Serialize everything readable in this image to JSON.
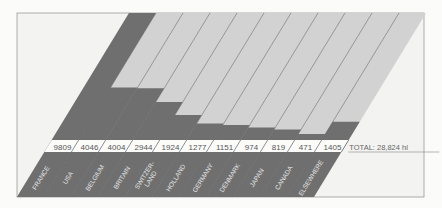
{
  "chart_data": {
    "type": "bar",
    "title": "SALES IN HECTOLITRES",
    "subtitle": "(Source: CIVB)",
    "categories": [
      "FRANCE",
      "USA",
      "BELGIUM",
      "BRITAIN",
      "SWITZERLAND",
      "HOLLAND",
      "GERMANY",
      "DENMARK",
      "JAPAN",
      "CANADA",
      "ELSEWHERE"
    ],
    "labels": [
      "FRANCE",
      "USA",
      "BELGIUM",
      "BRITAIN",
      "SWITZER-\nLAND",
      "HOLLAND",
      "GERMANY",
      "DENMARK",
      "JAPAN",
      "CANADA",
      "ELSEWHERE"
    ],
    "values": [
      9809,
      4046,
      4004,
      2944,
      1924,
      1277,
      1151,
      974,
      819,
      471,
      1405
    ],
    "value_labels": [
      "9809",
      "4046",
      "4004",
      "2944",
      "1924",
      "1277",
      "1151",
      "974",
      "819",
      "471",
      "1405"
    ],
    "total_label": "TOTAL: 28,824 hl",
    "unit": "hl",
    "colors": {
      "bar": "#6f6f6f",
      "remainder": "#d2d2d2",
      "background": "#f3f3f1",
      "frame": "#9a9a9a",
      "band": "#fbfbfa"
    }
  },
  "header": {
    "title_line1": "SALES IN",
    "title_line2": "HECTOLITRES",
    "source": "(Source: CIVB)"
  }
}
